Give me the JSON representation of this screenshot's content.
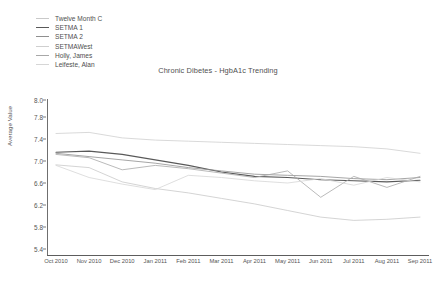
{
  "chart_data": {
    "type": "line",
    "title": "Chronic Dibetes - HgbA1c Trending",
    "xlabel": "",
    "ylabel": "Average Value",
    "grid": false,
    "legend_position": "top-left",
    "ylim": [
      5.4,
      8.0
    ],
    "ytick_labels": [
      "8.0",
      "7.8",
      "7.4",
      "7.0",
      "6.6",
      "6.2",
      "5.8",
      "5.4"
    ],
    "ytick_values": [
      8.0,
      7.8,
      7.4,
      7.0,
      6.6,
      6.2,
      5.8,
      5.4
    ],
    "categories": [
      "Oct 2010",
      "Nov 2010",
      "Dec 2010",
      "Jan 2011",
      "Feb 2011",
      "Mar 2011",
      "Apr 2011",
      "May 2011",
      "Jun 2011",
      "Jul 2011",
      "Aug 2011",
      "Sep 2011"
    ],
    "series": [
      {
        "name": "Twelve Month C",
        "color": "#c9c9c9",
        "values": [
          6.93,
          6.88,
          6.62,
          6.5,
          6.42,
          6.32,
          6.22,
          6.1,
          5.98,
          5.92,
          5.94,
          5.98
        ]
      },
      {
        "name": "SETMA 1",
        "color": "#595959",
        "values": [
          7.16,
          7.18,
          7.12,
          7.02,
          6.92,
          6.8,
          6.72,
          6.7,
          6.66,
          6.64,
          6.62,
          6.65
        ]
      },
      {
        "name": "SETMA 2",
        "color": "#8f8f8f",
        "values": [
          7.14,
          7.08,
          7.02,
          6.96,
          6.88,
          6.82,
          6.76,
          6.74,
          6.72,
          6.68,
          6.66,
          6.7
        ]
      },
      {
        "name": "SETMAWest",
        "color": "#cfcfcf",
        "values": [
          7.5,
          7.52,
          7.42,
          7.38,
          7.36,
          7.34,
          7.32,
          7.3,
          7.28,
          7.26,
          7.22,
          7.14
        ]
      },
      {
        "name": "Holly, James",
        "color": "#a8a8a8",
        "values": [
          7.12,
          7.06,
          6.84,
          6.92,
          6.86,
          6.78,
          6.7,
          6.82,
          6.34,
          6.72,
          6.52,
          6.72
        ]
      },
      {
        "name": "Leifeste, Alan",
        "color": "#d6d6d6",
        "values": [
          6.92,
          6.7,
          6.58,
          6.48,
          6.74,
          6.7,
          6.64,
          6.6,
          6.68,
          6.56,
          6.7,
          6.62
        ]
      }
    ]
  }
}
